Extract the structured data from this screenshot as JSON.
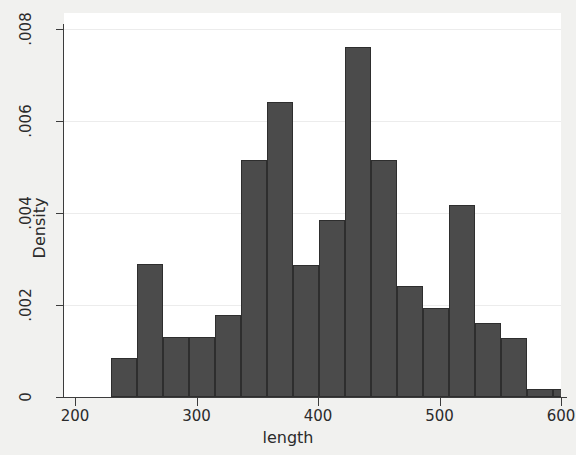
{
  "chart_data": {
    "type": "bar",
    "subtype": "histogram",
    "title": "",
    "xlabel": "length",
    "ylabel": "Density",
    "xlim": [
      200,
      600
    ],
    "ylim": [
      0,
      0.008
    ],
    "xticks": [
      "200",
      "300",
      "400",
      "500",
      "600"
    ],
    "xtick_values": [
      200,
      300,
      400,
      500,
      600
    ],
    "yticks": [
      "0",
      ".002",
      ".004",
      ".006",
      ".008"
    ],
    "ytick_values": [
      0,
      0.002,
      0.004,
      0.006,
      0.008
    ],
    "grid": "horizontal",
    "legend": "none",
    "bar_color": "#4b4b4b",
    "bar_edge_color": "#2e2e2e",
    "plot_background": "#ffffff",
    "figure_background": "#f1f1ef",
    "bin_width": 21.4,
    "bin_edges": [
      230.0,
      251.4,
      272.8,
      294.2,
      315.6,
      337.0,
      358.4,
      379.8,
      401.2,
      422.6,
      444.0,
      465.4,
      486.8,
      508.2,
      529.6,
      551.0,
      572.4,
      593.8
    ],
    "categories": [
      "230-251",
      "251-273",
      "273-294",
      "294-316",
      "316-337",
      "337-358",
      "358-380",
      "380-401",
      "401-423",
      "423-444",
      "444-465",
      "465-487",
      "487-508",
      "508-530",
      "530-551",
      "551-572",
      "572-594"
    ],
    "values": [
      0.00085,
      0.00289,
      0.0013,
      0.0013,
      0.00178,
      0.00516,
      0.00642,
      0.00287,
      0.00385,
      0.0076,
      0.00516,
      0.00241,
      0.00193,
      0.00417,
      0.00161,
      0.00128,
      0.00017
    ],
    "extra_tail_bin": {
      "range": "594-615",
      "value": 0.00017
    }
  }
}
